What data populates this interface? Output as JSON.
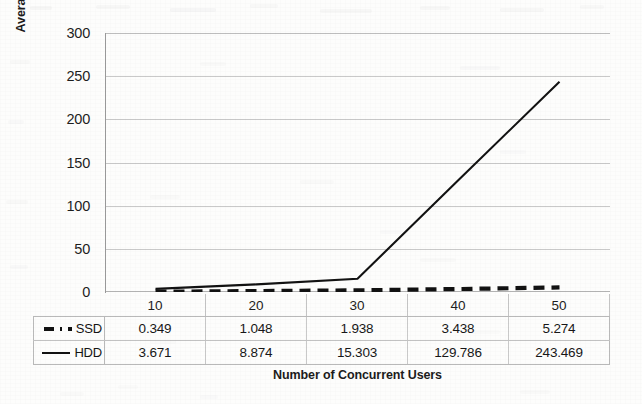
{
  "chart_data": {
    "type": "line",
    "title": "",
    "xlabel": "Number of Concurrent Users",
    "ylabel": "Average User Response Time (in s)",
    "categories": [
      "10",
      "20",
      "30",
      "40",
      "50"
    ],
    "series": [
      {
        "name": "SSD",
        "values": [
          0.349,
          1.048,
          1.938,
          3.438,
          5.274
        ],
        "value_labels": [
          "0.349",
          "1.048",
          "1.938",
          "3.438",
          "5.274"
        ],
        "style": "dashed",
        "color": "#111111"
      },
      {
        "name": "HDD",
        "values": [
          3.671,
          8.874,
          15.303,
          129.786,
          243.469
        ],
        "value_labels": [
          "3.671",
          "8.874",
          "15.303",
          "129.786",
          "243.469"
        ],
        "style": "solid",
        "color": "#111111"
      }
    ],
    "ylim": [
      0,
      300
    ],
    "yticks": [
      300,
      250,
      200,
      150,
      100,
      50,
      0
    ],
    "ytick_labels": [
      "300",
      "250",
      "200",
      "150",
      "100",
      "50",
      "0"
    ],
    "grid": true,
    "legend_position": "data-table-left",
    "data_table_visible": true
  },
  "axes": {
    "y_title": "Average User Response Time (in s)",
    "x_title": "Number of Concurrent Users"
  },
  "table": {
    "header_row": [
      "10",
      "20",
      "30",
      "40",
      "50"
    ],
    "rows": [
      {
        "label": "SSD",
        "marker": "dashed-line-swatch",
        "cells": [
          "0.349",
          "1.048",
          "1.938",
          "3.438",
          "5.274"
        ]
      },
      {
        "label": "HDD",
        "marker": "solid-line-swatch",
        "cells": [
          "3.671",
          "8.874",
          "15.303",
          "129.786",
          "243.469"
        ]
      }
    ]
  },
  "colors": {
    "line": "#111111",
    "gridline": "#c9c9c9",
    "axis": "#9a9a9a",
    "text": "#1b1b1b",
    "background": "#fdfdfc"
  }
}
